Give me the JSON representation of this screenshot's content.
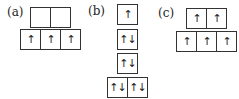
{
  "diagrams": [
    {
      "label": "(a)",
      "rows": [
        {
          "boxes": [
            "",
            ""
          ]
        },
        {
          "boxes": [
            "↑",
            "↑",
            "↑"
          ]
        }
      ]
    },
    {
      "label": "(b)",
      "rows": [
        {
          "boxes": [
            "↑"
          ]
        },
        {
          "boxes": [
            "↑↓"
          ]
        },
        {
          "boxes": [
            "↑↓"
          ]
        },
        {
          "boxes": [
            "↑↓",
            "↑↓"
          ]
        }
      ]
    },
    {
      "label": "(c)",
      "rows": [
        {
          "boxes": [
            "↑",
            "↑"
          ]
        },
        {
          "boxes": [
            "↑",
            "↑",
            "↑"
          ]
        }
      ]
    }
  ]
}
